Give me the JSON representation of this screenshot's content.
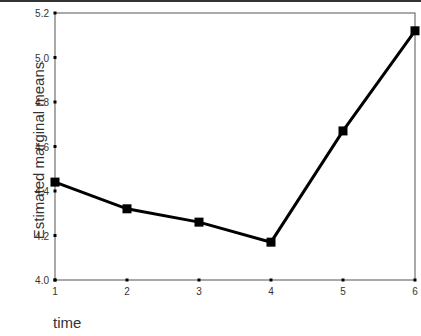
{
  "chart_data": {
    "type": "line",
    "title": "",
    "xlabel": "time",
    "ylabel": "Estimated marginal means",
    "categories": [
      "1",
      "2",
      "3",
      "4",
      "5",
      "6"
    ],
    "x": [
      1,
      2,
      3,
      4,
      5,
      6
    ],
    "values": [
      4.44,
      4.32,
      4.26,
      4.17,
      4.67,
      5.12
    ],
    "ylim": [
      4.0,
      5.2
    ],
    "yticks": [
      "4.0",
      "4.2",
      "4.4",
      "4.6",
      "4.8",
      "5.0",
      "5.2"
    ],
    "xticks": [
      "1",
      "2",
      "3",
      "4",
      "5",
      "6"
    ],
    "grid": false,
    "legend": null,
    "marker": "square",
    "line_color": "#000000"
  }
}
